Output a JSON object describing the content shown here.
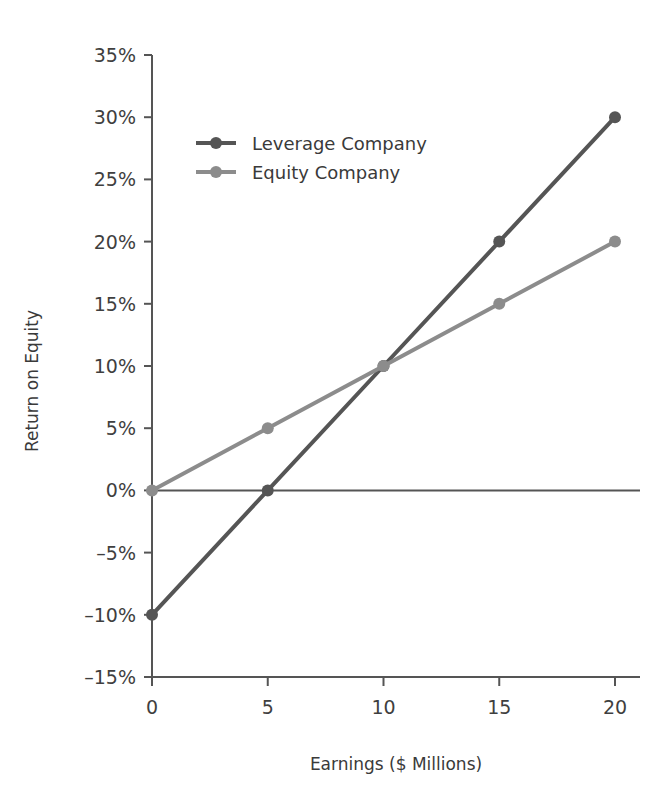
{
  "chart_data": {
    "type": "line",
    "title": "",
    "xlabel": "Earnings ($ Millions)",
    "ylabel": "Return on Equity",
    "x": [
      0,
      5,
      10,
      15,
      20
    ],
    "xlim": [
      0,
      20
    ],
    "ylim": [
      -15,
      35
    ],
    "grid": false,
    "legend_position": "upper left",
    "x_tick_labels": [
      "0",
      "5",
      "10",
      "15",
      "20"
    ],
    "y_tick_labels": [
      "35%",
      "30%",
      "25%",
      "20%",
      "15%",
      "10%",
      "5%",
      "0%",
      "–5%",
      "–10%",
      "–15%"
    ],
    "y_tick_values": [
      35,
      30,
      25,
      20,
      15,
      10,
      5,
      0,
      -5,
      -10,
      -15
    ],
    "series": [
      {
        "name": "Leverage Company",
        "color": "#555555",
        "marker": "circle",
        "values": [
          -10,
          0,
          10,
          20,
          30
        ]
      },
      {
        "name": "Equity Company",
        "color": "#8c8c8c",
        "marker": "circle",
        "values": [
          0,
          5,
          10,
          15,
          20
        ]
      }
    ],
    "zero_line": 0,
    "axis_color": "#555555"
  },
  "legend": {
    "entries": [
      {
        "label": "Leverage Company"
      },
      {
        "label": "Equity Company"
      }
    ]
  },
  "axes": {
    "x_title": "Earnings ($ Millions)",
    "y_title": "Return on Equity"
  },
  "y_ticks": [
    {
      "label": "35%"
    },
    {
      "label": "30%"
    },
    {
      "label": "25%"
    },
    {
      "label": "20%"
    },
    {
      "label": "15%"
    },
    {
      "label": "10%"
    },
    {
      "label": "5%"
    },
    {
      "label": "0%"
    },
    {
      "label": "–5%"
    },
    {
      "label": "–10%"
    },
    {
      "label": "–15%"
    }
  ],
  "x_ticks": [
    {
      "label": "0"
    },
    {
      "label": "5"
    },
    {
      "label": "10"
    },
    {
      "label": "15"
    },
    {
      "label": "20"
    }
  ]
}
